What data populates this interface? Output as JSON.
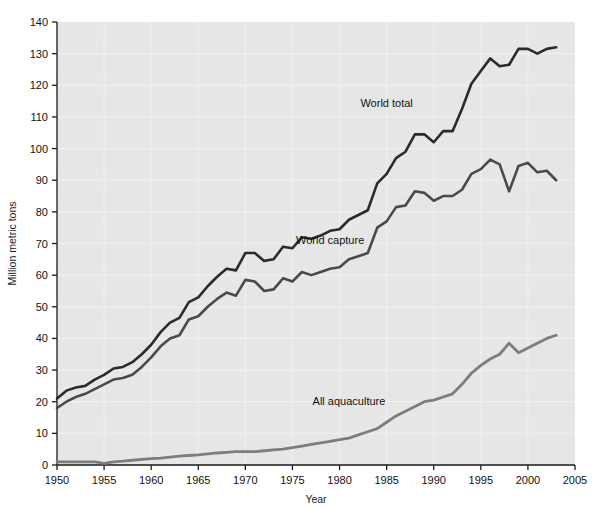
{
  "chart_data": {
    "type": "line",
    "title": "",
    "xlabel": "Year",
    "ylabel": "Million metric tons",
    "xlim": [
      1950,
      2005
    ],
    "ylim": [
      0,
      140
    ],
    "xticks": [
      1950,
      1955,
      1960,
      1965,
      1970,
      1975,
      1980,
      1985,
      1990,
      1995,
      2000,
      2005
    ],
    "yticks": [
      0,
      10,
      20,
      30,
      40,
      50,
      60,
      70,
      80,
      90,
      100,
      110,
      120,
      130,
      140
    ],
    "grid": true,
    "legend_position": "inline-annotations",
    "plot_background": "#e6e6e6",
    "gridline_color": "#f2f2f2",
    "x": [
      1950,
      1951,
      1952,
      1953,
      1954,
      1955,
      1956,
      1957,
      1958,
      1959,
      1960,
      1961,
      1962,
      1963,
      1964,
      1965,
      1966,
      1967,
      1968,
      1969,
      1970,
      1971,
      1972,
      1973,
      1974,
      1975,
      1976,
      1977,
      1978,
      1979,
      1980,
      1981,
      1982,
      1983,
      1984,
      1985,
      1986,
      1987,
      1988,
      1989,
      1990,
      1991,
      1992,
      1993,
      1994,
      1995,
      1996,
      1997,
      1998,
      1999,
      2000,
      2001,
      2002,
      2003
    ],
    "series": [
      {
        "name": "World total",
        "color": "#2b2b2b",
        "width": 2.6,
        "label_x": 1985,
        "label_y": 113,
        "values": [
          21.0,
          23.5,
          24.5,
          25.0,
          27.0,
          28.5,
          30.5,
          31.0,
          32.5,
          35.0,
          38.0,
          42.0,
          45.0,
          46.5,
          51.5,
          53.0,
          56.5,
          59.5,
          62.0,
          61.5,
          67.0,
          67.0,
          64.5,
          65.0,
          69.0,
          68.5,
          72.0,
          71.5,
          72.5,
          74.0,
          74.5,
          77.5,
          79.0,
          80.5,
          89.0,
          92.0,
          97.0,
          99.0,
          104.5,
          104.5,
          102.0,
          105.5,
          105.5,
          112.5,
          120.5,
          124.5,
          128.5,
          126.0,
          126.5,
          131.5,
          131.5,
          130.0,
          131.5,
          132.0
        ]
      },
      {
        "name": "World capture",
        "color": "#4a4a4a",
        "width": 2.6,
        "label_x": 1979,
        "label_y": 70,
        "values": [
          18.0,
          20.0,
          21.5,
          22.5,
          24.0,
          25.5,
          27.0,
          27.5,
          28.5,
          31.0,
          34.0,
          37.5,
          40.0,
          41.0,
          46.0,
          47.0,
          50.0,
          52.5,
          54.5,
          53.5,
          58.5,
          58.0,
          55.0,
          55.5,
          59.0,
          58.0,
          61.0,
          60.0,
          61.0,
          62.0,
          62.5,
          65.0,
          66.0,
          67.0,
          75.0,
          77.0,
          81.5,
          82.0,
          86.5,
          86.0,
          83.5,
          85.0,
          85.0,
          87.0,
          92.0,
          93.5,
          96.5,
          95.0,
          86.5,
          94.5,
          95.5,
          92.5,
          93.0,
          90.0
        ]
      },
      {
        "name": "All aquaculture",
        "color": "#7d7d7d",
        "width": 2.8,
        "label_x": 1981,
        "label_y": 19,
        "values": [
          1.0,
          1.0,
          1.0,
          1.0,
          1.0,
          0.5,
          1.0,
          1.2,
          1.5,
          1.8,
          2.0,
          2.2,
          2.5,
          2.8,
          3.0,
          3.2,
          3.5,
          3.8,
          4.0,
          4.2,
          4.2,
          4.2,
          4.5,
          4.8,
          5.0,
          5.5,
          6.0,
          6.5,
          7.0,
          7.5,
          8.0,
          8.5,
          9.5,
          10.5,
          11.5,
          13.5,
          15.5,
          17.0,
          18.5,
          20.0,
          20.5,
          21.5,
          22.5,
          25.5,
          29.0,
          31.5,
          33.5,
          35.0,
          38.5,
          35.5,
          37.0,
          38.5,
          40.0,
          41.0
        ]
      }
    ]
  },
  "axes": {
    "ylabel": "Million metric tons",
    "xlabel": "Year",
    "xtick_labels": [
      "1950",
      "1955",
      "1960",
      "1965",
      "1970",
      "1975",
      "1980",
      "1985",
      "1990",
      "1995",
      "2000",
      "2005"
    ],
    "ytick_labels": [
      "0",
      "10",
      "20",
      "30",
      "40",
      "50",
      "60",
      "70",
      "80",
      "90",
      "100",
      "110",
      "120",
      "130",
      "140"
    ]
  },
  "annotations": [
    {
      "text": "World total"
    },
    {
      "text": "World capture"
    },
    {
      "text": "All aquaculture"
    }
  ],
  "colors": {
    "world_total": "#2b2b2b",
    "world_capture": "#4a4a4a",
    "all_aquaculture": "#7d7d7d",
    "plot_bg": "#e6e6e6",
    "grid": "#f2f2f2",
    "axis": "#1a1a1a",
    "page_bg": "#ffffff"
  }
}
